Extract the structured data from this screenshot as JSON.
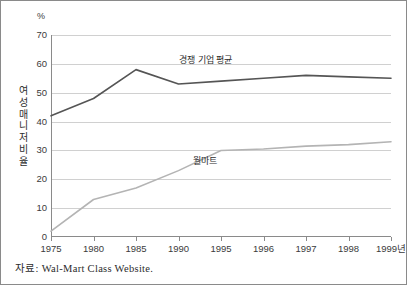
{
  "chart_data": {
    "type": "line",
    "title": "",
    "xlabel": "",
    "ylabel": "여성매니저비율",
    "ylabel_chars": [
      "여",
      "성",
      "매",
      "니",
      "저",
      "비",
      "율"
    ],
    "unit_label": "%",
    "categories": [
      "1975",
      "1980",
      "1985",
      "1990",
      "1995",
      "1996",
      "1997",
      "1998",
      "1999년"
    ],
    "ylim": [
      0,
      70
    ],
    "yticks": [
      0,
      10,
      20,
      30,
      40,
      50,
      60,
      70
    ],
    "grid": true,
    "legend_position": "inline-annotation",
    "series": [
      {
        "name": "경쟁 기업 평균",
        "color": "#555555",
        "values": [
          42,
          48,
          58,
          53,
          54,
          55,
          56,
          55.5,
          55
        ]
      },
      {
        "name": "월마트",
        "color": "#b4b4b4",
        "values": [
          2,
          13,
          17,
          23,
          30,
          30.5,
          31.5,
          32,
          33
        ]
      }
    ],
    "annotations": [
      {
        "text": "경쟁 기업 평균",
        "series": "경쟁 기업 평균"
      },
      {
        "text": "월마트",
        "series": "월마트"
      }
    ],
    "source": "자료: Wal-Mart Class Website."
  },
  "colors": {
    "competitor_line": "#555555",
    "walmart_line": "#b4b4b4",
    "gridline": "#d0d0d0",
    "axis": "#8a8a8a",
    "text": "#2d2d2d",
    "background": "#ffffff"
  }
}
